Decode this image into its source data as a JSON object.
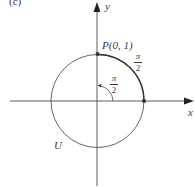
{
  "figure": {
    "panel_label": "(c)",
    "axes": {
      "x_label": "x",
      "y_label": "y"
    },
    "circle": {
      "label": "U",
      "center": [
        0,
        0
      ],
      "radius": 1
    },
    "point": {
      "label": "P(0, 1)",
      "coords": [
        0,
        1
      ]
    },
    "arc_label": {
      "numerator": "π",
      "denominator": "2"
    },
    "angle_label": {
      "numerator": "π",
      "denominator": "2"
    },
    "colors": {
      "line": "#4a4a4a",
      "text": "#3a3a3a",
      "background": "#ffffff"
    }
  }
}
